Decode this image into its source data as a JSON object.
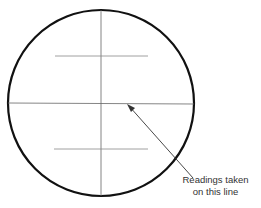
{
  "diagram": {
    "annotation": {
      "line1": "Readings taken",
      "line2": "on this line"
    },
    "colors": {
      "circle": "#111111",
      "lines": "#666666",
      "arrow": "#333333",
      "text": "#333333"
    }
  }
}
